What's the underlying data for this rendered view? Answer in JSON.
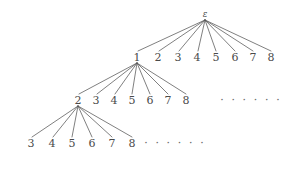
{
  "figure": {
    "kind": "tree-diagram",
    "width": 287,
    "height": 178,
    "background_color": "#ffffff",
    "edge_color": "#555555",
    "label_color": "#4a4a4a",
    "ellipsis_color": "#6a6a6a"
  },
  "levels": [
    {
      "name": "level-0",
      "y": 14,
      "nodes": [
        {
          "label": "ε",
          "x": 205,
          "y": 14,
          "italic": true,
          "expanded": true
        }
      ]
    },
    {
      "name": "level-1",
      "y": 57,
      "nodes": [
        {
          "label": "1",
          "x": 137,
          "y": 57,
          "expanded": true
        },
        {
          "label": "2",
          "x": 158,
          "y": 57,
          "expanded": false
        },
        {
          "label": "3",
          "x": 178,
          "y": 57,
          "expanded": false
        },
        {
          "label": "4",
          "x": 197,
          "y": 57,
          "expanded": false
        },
        {
          "label": "5",
          "x": 216,
          "y": 57,
          "expanded": false
        },
        {
          "label": "6",
          "x": 235,
          "y": 57,
          "expanded": false
        },
        {
          "label": "7",
          "x": 253,
          "y": 57,
          "expanded": false
        },
        {
          "label": "8",
          "x": 271,
          "y": 57,
          "expanded": false
        }
      ],
      "ellipsis": null
    },
    {
      "name": "level-2",
      "y": 100,
      "nodes": [
        {
          "label": "2",
          "x": 78,
          "y": 100,
          "expanded": true
        },
        {
          "label": "3",
          "x": 96,
          "y": 100,
          "expanded": false
        },
        {
          "label": "4",
          "x": 114,
          "y": 100,
          "expanded": false
        },
        {
          "label": "5",
          "x": 132,
          "y": 100,
          "expanded": false
        },
        {
          "label": "6",
          "x": 150,
          "y": 100,
          "expanded": false
        },
        {
          "label": "7",
          "x": 168,
          "y": 100,
          "expanded": false
        },
        {
          "label": "8",
          "x": 186,
          "y": 100,
          "expanded": false
        }
      ],
      "ellipsis": {
        "text": "· · · · · ·",
        "x": 251,
        "y": 100
      }
    },
    {
      "name": "level-3",
      "y": 143,
      "nodes": [
        {
          "label": "3",
          "x": 31,
          "y": 143,
          "expanded": false
        },
        {
          "label": "4",
          "x": 52,
          "y": 143,
          "expanded": false
        },
        {
          "label": "5",
          "x": 72,
          "y": 143,
          "expanded": false
        },
        {
          "label": "6",
          "x": 92,
          "y": 143,
          "expanded": false
        },
        {
          "label": "7",
          "x": 112,
          "y": 143,
          "expanded": false
        },
        {
          "label": "8",
          "x": 132,
          "y": 143,
          "expanded": false
        }
      ],
      "ellipsis": {
        "text": "· · · · · ·",
        "x": 175,
        "y": 143
      }
    }
  ],
  "edges": [
    {
      "from": [
        205,
        20
      ],
      "to": [
        138,
        51
      ],
      "parent": "ε",
      "child": "1"
    },
    {
      "from": [
        205,
        20
      ],
      "to": [
        159,
        51
      ],
      "parent": "ε",
      "child": "2"
    },
    {
      "from": [
        205,
        20
      ],
      "to": [
        179,
        51
      ],
      "parent": "ε",
      "child": "3"
    },
    {
      "from": [
        205,
        20
      ],
      "to": [
        198,
        51
      ],
      "parent": "ε",
      "child": "4"
    },
    {
      "from": [
        205,
        20
      ],
      "to": [
        216,
        51
      ],
      "parent": "ε",
      "child": "5"
    },
    {
      "from": [
        205,
        20
      ],
      "to": [
        235,
        51
      ],
      "parent": "ε",
      "child": "6"
    },
    {
      "from": [
        205,
        20
      ],
      "to": [
        253,
        51
      ],
      "parent": "ε",
      "child": "7"
    },
    {
      "from": [
        205,
        20
      ],
      "to": [
        271,
        51
      ],
      "parent": "ε",
      "child": "8"
    },
    {
      "from": [
        137,
        63
      ],
      "to": [
        79,
        94
      ],
      "parent": "1",
      "child": "2"
    },
    {
      "from": [
        137,
        63
      ],
      "to": [
        97,
        94
      ],
      "parent": "1",
      "child": "3"
    },
    {
      "from": [
        137,
        63
      ],
      "to": [
        115,
        94
      ],
      "parent": "1",
      "child": "4"
    },
    {
      "from": [
        137,
        63
      ],
      "to": [
        132,
        94
      ],
      "parent": "1",
      "child": "5"
    },
    {
      "from": [
        137,
        63
      ],
      "to": [
        150,
        94
      ],
      "parent": "1",
      "child": "6"
    },
    {
      "from": [
        137,
        63
      ],
      "to": [
        168,
        94
      ],
      "parent": "1",
      "child": "7"
    },
    {
      "from": [
        137,
        63
      ],
      "to": [
        186,
        94
      ],
      "parent": "1",
      "child": "8"
    },
    {
      "from": [
        78,
        106
      ],
      "to": [
        32,
        137
      ],
      "parent": "2",
      "child": "3"
    },
    {
      "from": [
        78,
        106
      ],
      "to": [
        53,
        137
      ],
      "parent": "2",
      "child": "4"
    },
    {
      "from": [
        78,
        106
      ],
      "to": [
        72,
        137
      ],
      "parent": "2",
      "child": "5"
    },
    {
      "from": [
        78,
        106
      ],
      "to": [
        92,
        137
      ],
      "parent": "2",
      "child": "6"
    },
    {
      "from": [
        78,
        106
      ],
      "to": [
        112,
        137
      ],
      "parent": "2",
      "child": "7"
    },
    {
      "from": [
        78,
        106
      ],
      "to": [
        132,
        137
      ],
      "parent": "2",
      "child": "8"
    }
  ]
}
